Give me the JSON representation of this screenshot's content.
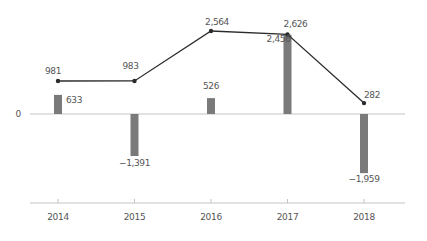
{
  "chart_data": {
    "type": "bar",
    "title": "",
    "xlabel": "",
    "ylabel": "",
    "categories": [
      "2014",
      "2015",
      "2016",
      "2017",
      "2018"
    ],
    "series": [
      {
        "name": "bars",
        "type": "bar",
        "values": [
          633,
          -1391,
          526,
          2626,
          -1959
        ],
        "labels": [
          "633",
          "-1,391",
          "526",
          "2,626",
          "-1,959"
        ]
      },
      {
        "name": "line",
        "type": "line",
        "values": [
          981,
          983,
          2564,
          2456,
          282
        ],
        "labels": [
          "981",
          "983",
          "2,564",
          "2,456",
          "282"
        ]
      }
    ],
    "zero_label": "0",
    "grid": false,
    "legend": "none",
    "colors": {
      "bar": "#7a7a7a",
      "line": "#2b2b2b",
      "axis": "#bdbdbd",
      "text": "#555555"
    }
  }
}
